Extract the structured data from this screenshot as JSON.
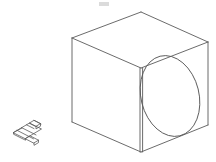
{
  "scene": {
    "title": "Isometric wireframe cube with circular hole and small bracket part",
    "background_color": "#ffffff",
    "line_color": "#5a5a5a",
    "line_color_dark": "#3c3c3c",
    "line_width": 0.9,
    "width": 216,
    "height": 162
  },
  "cube": {
    "label": "isometric wireframe cube",
    "vertices": {
      "top_back": "141,12",
      "top_left": "72,38",
      "top_right": "208,42",
      "top_front": "141,68",
      "bottom_left": "72,122",
      "bottom_right": "208,125",
      "bottom_front": "141,152"
    },
    "edges": [
      "top_back-top_left",
      "top_back-top_right",
      "top_left-top_front",
      "top_right-top_front",
      "top_left-bottom_left",
      "top_right-bottom_right",
      "top_front-bottom_front",
      "bottom_left-bottom_front",
      "bottom_front-bottom_right"
    ],
    "front_vertical_edge_doubled": "yes"
  },
  "hole": {
    "label": "elliptical hole on right face",
    "center_x": 170,
    "center_y": 96,
    "radius_x": 29,
    "radius_y": 41,
    "rotation_deg": -14
  },
  "bracket": {
    "label": "small isometric bracket part",
    "origin_x": 12,
    "origin_y": 118,
    "width": 30,
    "height": 26
  },
  "smudge": {
    "label": "faint gray mark near top",
    "x": 99,
    "y": 2,
    "width": 10,
    "height": 4,
    "color": "#cfcfcf"
  }
}
